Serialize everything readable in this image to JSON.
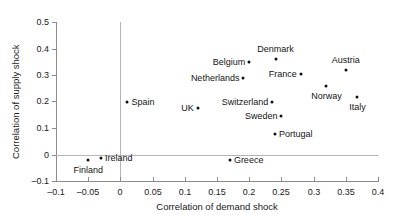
{
  "chart_data": {
    "type": "scatter",
    "title": "",
    "xlabel": "Correlation of demand shock",
    "ylabel": "Correlation of supply shock",
    "xlim": [
      -0.1,
      0.4
    ],
    "ylim": [
      -0.1,
      0.5
    ],
    "xticks": [
      "–0.1",
      "–0.05",
      "0",
      "0.05",
      "0.1",
      "0.15",
      "0.2",
      "0.25",
      "0.3",
      "0.35",
      "0.4"
    ],
    "xtick_values": [
      -0.1,
      -0.05,
      0,
      0.05,
      0.1,
      0.15,
      0.2,
      0.25,
      0.3,
      0.35,
      0.4
    ],
    "yticks": [
      "–0.1",
      "0",
      "0.1",
      "0.2",
      "0.3",
      "0.4",
      "0.5"
    ],
    "ytick_values": [
      -0.1,
      0,
      0.1,
      0.2,
      0.3,
      0.4,
      0.5
    ],
    "grid": false,
    "legend": "none",
    "marker_color": "#111111",
    "axis_color": "#8c8c8c",
    "zero_line_color": "#b5b5b5",
    "points": [
      {
        "label": "Finland",
        "x": -0.05,
        "y": -0.02,
        "label_pos": "below"
      },
      {
        "label": "Ireland",
        "x": -0.03,
        "y": -0.015,
        "label_pos": "right"
      },
      {
        "label": "Spain",
        "x": 0.011,
        "y": 0.198,
        "label_pos": "right"
      },
      {
        "label": "UK",
        "x": 0.12,
        "y": 0.177,
        "label_pos": "left"
      },
      {
        "label": "Greece",
        "x": 0.17,
        "y": -0.022,
        "label_pos": "right"
      },
      {
        "label": "Netherlands",
        "x": 0.191,
        "y": 0.29,
        "label_pos": "left"
      },
      {
        "label": "Belgium",
        "x": 0.2,
        "y": 0.35,
        "label_pos": "left"
      },
      {
        "label": "Switzerland",
        "x": 0.236,
        "y": 0.2,
        "label_pos": "left"
      },
      {
        "label": "Denmark",
        "x": 0.241,
        "y": 0.36,
        "label_pos": "above"
      },
      {
        "label": "Portugal",
        "x": 0.24,
        "y": 0.078,
        "label_pos": "right"
      },
      {
        "label": "Sweden",
        "x": 0.25,
        "y": 0.145,
        "label_pos": "left"
      },
      {
        "label": "France",
        "x": 0.28,
        "y": 0.305,
        "label_pos": "left"
      },
      {
        "label": "Norway",
        "x": 0.32,
        "y": 0.258,
        "label_pos": "below"
      },
      {
        "label": "Austria",
        "x": 0.35,
        "y": 0.318,
        "label_pos": "above"
      },
      {
        "label": "Italy",
        "x": 0.368,
        "y": 0.217,
        "label_pos": "below"
      }
    ]
  }
}
